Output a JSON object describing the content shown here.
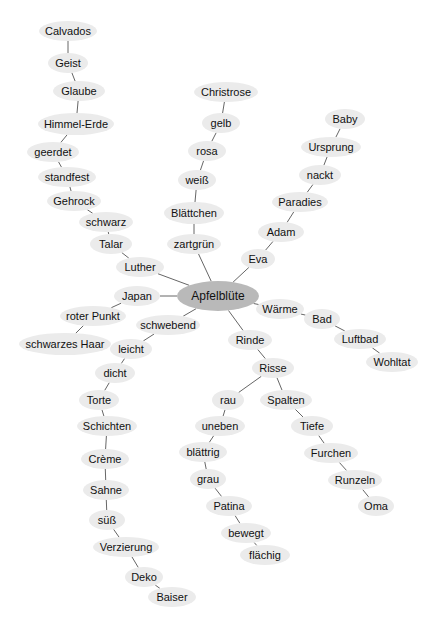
{
  "diagram": {
    "type": "mind-map",
    "root": "apfelbluete",
    "colors": {
      "node_fill": "#ebebeb",
      "center_fill": "#b9b9b9",
      "edge": "#555555",
      "text": "#111111",
      "background": "#ffffff"
    },
    "nodes": [
      {
        "id": "apfelbluete",
        "label": "Apfelblüte",
        "x": 218,
        "y": 296,
        "rx": 41,
        "ry": 15,
        "center": true
      },
      {
        "id": "luther",
        "label": "Luther",
        "x": 140,
        "y": 267,
        "rx": 24,
        "ry": 10
      },
      {
        "id": "talar",
        "label": "Talar",
        "x": 111,
        "y": 244,
        "rx": 21,
        "ry": 10
      },
      {
        "id": "schwarz",
        "label": "schwarz",
        "x": 106,
        "y": 222,
        "rx": 27,
        "ry": 10
      },
      {
        "id": "gehrock",
        "label": "Gehrock",
        "x": 74,
        "y": 201,
        "rx": 27,
        "ry": 10
      },
      {
        "id": "standfest",
        "label": "standfest",
        "x": 67,
        "y": 177,
        "rx": 29,
        "ry": 10
      },
      {
        "id": "geerdet",
        "label": "geerdet",
        "x": 53,
        "y": 152,
        "rx": 26,
        "ry": 10
      },
      {
        "id": "himmel-erde",
        "label": "Himmel-Erde",
        "x": 76,
        "y": 124,
        "rx": 38,
        "ry": 11
      },
      {
        "id": "glaube",
        "label": "Glaube",
        "x": 79,
        "y": 91,
        "rx": 26,
        "ry": 10
      },
      {
        "id": "geist",
        "label": "Geist",
        "x": 68,
        "y": 63,
        "rx": 20,
        "ry": 10
      },
      {
        "id": "calvados",
        "label": "Calvados",
        "x": 68,
        "y": 31,
        "rx": 29,
        "ry": 10
      },
      {
        "id": "zartgruen",
        "label": "zartgrün",
        "x": 194,
        "y": 244,
        "rx": 27,
        "ry": 10
      },
      {
        "id": "blaettchen",
        "label": "Blättchen",
        "x": 194,
        "y": 213,
        "rx": 30,
        "ry": 11
      },
      {
        "id": "weiss",
        "label": "weiß",
        "x": 197,
        "y": 180,
        "rx": 19,
        "ry": 10
      },
      {
        "id": "rosa",
        "label": "rosa",
        "x": 207,
        "y": 151,
        "rx": 19,
        "ry": 10
      },
      {
        "id": "gelb",
        "label": "gelb",
        "x": 221,
        "y": 123,
        "rx": 19,
        "ry": 10
      },
      {
        "id": "christrose",
        "label": "Christrose",
        "x": 226,
        "y": 92,
        "rx": 32,
        "ry": 10
      },
      {
        "id": "eva",
        "label": "Eva",
        "x": 258,
        "y": 259,
        "rx": 17,
        "ry": 10
      },
      {
        "id": "adam",
        "label": "Adam",
        "x": 281,
        "y": 232,
        "rx": 23,
        "ry": 10
      },
      {
        "id": "paradies",
        "label": "Paradies",
        "x": 300,
        "y": 202,
        "rx": 28,
        "ry": 10
      },
      {
        "id": "nackt",
        "label": "nackt",
        "x": 320,
        "y": 175,
        "rx": 21,
        "ry": 10
      },
      {
        "id": "ursprung",
        "label": "Ursprung",
        "x": 331,
        "y": 147,
        "rx": 30,
        "ry": 10
      },
      {
        "id": "baby",
        "label": "Baby",
        "x": 345,
        "y": 119,
        "rx": 20,
        "ry": 10
      },
      {
        "id": "japan",
        "label": "Japan",
        "x": 137,
        "y": 296,
        "rx": 23,
        "ry": 10
      },
      {
        "id": "roter-punkt",
        "label": "roter Punkt",
        "x": 93,
        "y": 316,
        "rx": 33,
        "ry": 10
      },
      {
        "id": "schwarzes-haar",
        "label": "schwarzes Haar",
        "x": 65,
        "y": 344,
        "rx": 46,
        "ry": 11
      },
      {
        "id": "schwebend",
        "label": "schwebend",
        "x": 168,
        "y": 325,
        "rx": 32,
        "ry": 10
      },
      {
        "id": "leicht",
        "label": "leicht",
        "x": 131,
        "y": 349,
        "rx": 21,
        "ry": 10
      },
      {
        "id": "dicht",
        "label": "dicht",
        "x": 115,
        "y": 373,
        "rx": 20,
        "ry": 10
      },
      {
        "id": "torte",
        "label": "Torte",
        "x": 99,
        "y": 400,
        "rx": 20,
        "ry": 10
      },
      {
        "id": "schichten",
        "label": "Schichten",
        "x": 107,
        "y": 426,
        "rx": 30,
        "ry": 10
      },
      {
        "id": "creme",
        "label": "Crème",
        "x": 105,
        "y": 459,
        "rx": 24,
        "ry": 10
      },
      {
        "id": "sahne",
        "label": "Sahne",
        "x": 106,
        "y": 490,
        "rx": 23,
        "ry": 10
      },
      {
        "id": "suess",
        "label": "süß",
        "x": 107,
        "y": 520,
        "rx": 18,
        "ry": 10
      },
      {
        "id": "verzierung",
        "label": "Verzierung",
        "x": 126,
        "y": 547,
        "rx": 33,
        "ry": 10
      },
      {
        "id": "deko",
        "label": "Deko",
        "x": 144,
        "y": 577,
        "rx": 19,
        "ry": 10
      },
      {
        "id": "baiser",
        "label": "Baiser",
        "x": 172,
        "y": 597,
        "rx": 24,
        "ry": 10
      },
      {
        "id": "waerme",
        "label": "Wärme",
        "x": 280,
        "y": 309,
        "rx": 24,
        "ry": 10
      },
      {
        "id": "bad",
        "label": "Bad",
        "x": 322,
        "y": 319,
        "rx": 18,
        "ry": 10
      },
      {
        "id": "luftbad",
        "label": "Luftbad",
        "x": 360,
        "y": 339,
        "rx": 26,
        "ry": 10
      },
      {
        "id": "wohltat",
        "label": "Wohltat",
        "x": 392,
        "y": 362,
        "rx": 26,
        "ry": 10
      },
      {
        "id": "rinde",
        "label": "Rinde",
        "x": 250,
        "y": 340,
        "rx": 22,
        "ry": 10
      },
      {
        "id": "risse",
        "label": "Risse",
        "x": 273,
        "y": 368,
        "rx": 21,
        "ry": 10
      },
      {
        "id": "rau",
        "label": "rau",
        "x": 228,
        "y": 400,
        "rx": 16,
        "ry": 10
      },
      {
        "id": "uneben",
        "label": "uneben",
        "x": 220,
        "y": 426,
        "rx": 25,
        "ry": 10
      },
      {
        "id": "blaettrig",
        "label": "blättrig",
        "x": 203,
        "y": 452,
        "rx": 24,
        "ry": 10
      },
      {
        "id": "grau",
        "label": "grau",
        "x": 208,
        "y": 479,
        "rx": 18,
        "ry": 10
      },
      {
        "id": "patina",
        "label": "Patina",
        "x": 229,
        "y": 506,
        "rx": 23,
        "ry": 10
      },
      {
        "id": "bewegt",
        "label": "bewegt",
        "x": 246,
        "y": 533,
        "rx": 25,
        "ry": 10
      },
      {
        "id": "flaechig",
        "label": "flächig",
        "x": 265,
        "y": 555,
        "rx": 25,
        "ry": 10
      },
      {
        "id": "spalten",
        "label": "Spalten",
        "x": 286,
        "y": 400,
        "rx": 26,
        "ry": 10
      },
      {
        "id": "tiefe",
        "label": "Tiefe",
        "x": 312,
        "y": 426,
        "rx": 21,
        "ry": 10
      },
      {
        "id": "furchen",
        "label": "Furchen",
        "x": 331,
        "y": 453,
        "rx": 27,
        "ry": 10
      },
      {
        "id": "runzeln",
        "label": "Runzeln",
        "x": 355,
        "y": 480,
        "rx": 27,
        "ry": 10
      },
      {
        "id": "oma",
        "label": "Oma",
        "x": 376,
        "y": 506,
        "rx": 18,
        "ry": 10
      }
    ],
    "edges": [
      [
        "apfelbluete",
        "luther"
      ],
      [
        "luther",
        "talar"
      ],
      [
        "talar",
        "schwarz"
      ],
      [
        "schwarz",
        "gehrock"
      ],
      [
        "gehrock",
        "standfest"
      ],
      [
        "standfest",
        "geerdet"
      ],
      [
        "geerdet",
        "himmel-erde"
      ],
      [
        "himmel-erde",
        "glaube"
      ],
      [
        "glaube",
        "geist"
      ],
      [
        "geist",
        "calvados"
      ],
      [
        "apfelbluete",
        "zartgruen"
      ],
      [
        "zartgruen",
        "blaettchen"
      ],
      [
        "blaettchen",
        "weiss"
      ],
      [
        "weiss",
        "rosa"
      ],
      [
        "rosa",
        "gelb"
      ],
      [
        "gelb",
        "christrose"
      ],
      [
        "apfelbluete",
        "eva"
      ],
      [
        "eva",
        "adam"
      ],
      [
        "adam",
        "paradies"
      ],
      [
        "paradies",
        "nackt"
      ],
      [
        "nackt",
        "ursprung"
      ],
      [
        "ursprung",
        "baby"
      ],
      [
        "apfelbluete",
        "japan"
      ],
      [
        "japan",
        "roter-punkt"
      ],
      [
        "roter-punkt",
        "schwarzes-haar"
      ],
      [
        "apfelbluete",
        "schwebend"
      ],
      [
        "schwebend",
        "leicht"
      ],
      [
        "leicht",
        "dicht"
      ],
      [
        "dicht",
        "torte"
      ],
      [
        "torte",
        "schichten"
      ],
      [
        "schichten",
        "creme"
      ],
      [
        "creme",
        "sahne"
      ],
      [
        "sahne",
        "suess"
      ],
      [
        "suess",
        "verzierung"
      ],
      [
        "verzierung",
        "deko"
      ],
      [
        "deko",
        "baiser"
      ],
      [
        "apfelbluete",
        "waerme"
      ],
      [
        "waerme",
        "bad"
      ],
      [
        "bad",
        "luftbad"
      ],
      [
        "luftbad",
        "wohltat"
      ],
      [
        "apfelbluete",
        "rinde"
      ],
      [
        "rinde",
        "risse"
      ],
      [
        "risse",
        "rau"
      ],
      [
        "rau",
        "uneben"
      ],
      [
        "uneben",
        "blaettrig"
      ],
      [
        "blaettrig",
        "grau"
      ],
      [
        "grau",
        "patina"
      ],
      [
        "patina",
        "bewegt"
      ],
      [
        "bewegt",
        "flaechig"
      ],
      [
        "risse",
        "spalten"
      ],
      [
        "spalten",
        "tiefe"
      ],
      [
        "tiefe",
        "furchen"
      ],
      [
        "furchen",
        "runzeln"
      ],
      [
        "runzeln",
        "oma"
      ]
    ]
  }
}
